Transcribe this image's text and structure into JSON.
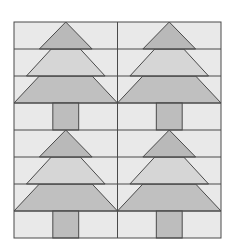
{
  "diagram": {
    "type": "quilt-block",
    "layout": {
      "columns": 2,
      "rows": 2,
      "block_rows": 4
    },
    "frame": {
      "left": 14,
      "top": 22,
      "right": 221,
      "bottom": 238,
      "center_x": 117.5
    },
    "colors": {
      "background": "#e9e9e9",
      "tier_top": "#b9b9b9",
      "tier_middle": "#d6d6d6",
      "tier_bottom": "#c0c0c0",
      "trunk": "#bdbdbd",
      "line": "#4a4a4a",
      "page": "#ffffff"
    },
    "trees": [
      {
        "name": "tree-top-left",
        "col": 0,
        "row": 0
      },
      {
        "name": "tree-top-right",
        "col": 1,
        "row": 0
      },
      {
        "name": "tree-bottom-left",
        "col": 0,
        "row": 1
      },
      {
        "name": "tree-bottom-right",
        "col": 1,
        "row": 1
      }
    ]
  }
}
